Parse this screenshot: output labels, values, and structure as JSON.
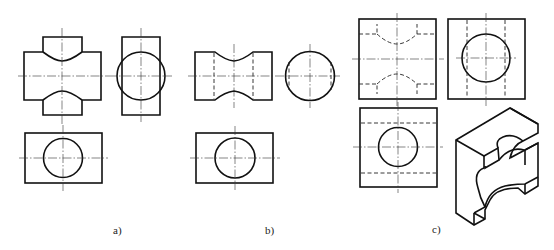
{
  "figure": {
    "panels": [
      {
        "id": "a",
        "caption": "a)",
        "views": [
          "front-view",
          "side-view",
          "top-view"
        ],
        "description": "Block with cylindrical hole; notched top/bottom bosses with curved saddle"
      },
      {
        "id": "b",
        "caption": "b)",
        "views": [
          "front-view",
          "side-view",
          "top-view"
        ],
        "description": "Block with concave waist; hidden lines for cylinder edges"
      },
      {
        "id": "c",
        "caption": "c)",
        "views": [
          "front-view",
          "side-view",
          "top-view",
          "isometric-view"
        ],
        "description": "Square block with through hole and curved cut-outs; isometric pictorial"
      }
    ]
  }
}
